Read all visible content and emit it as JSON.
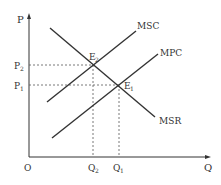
{
  "diagram": {
    "type": "economics-externality",
    "axes": {
      "y_label": "P",
      "x_label": "Q",
      "origin_label": "O"
    },
    "curves": [
      {
        "name": "MSC",
        "label": "MSC"
      },
      {
        "name": "MPC",
        "label": "MPC"
      },
      {
        "name": "MSR",
        "label": "MSR"
      }
    ],
    "points": [
      {
        "name": "E2",
        "label": "E",
        "sub": "2"
      },
      {
        "name": "E1",
        "label": "E",
        "sub": "1"
      }
    ],
    "price_levels": [
      {
        "label": "P",
        "sub": "2"
      },
      {
        "label": "P",
        "sub": "1"
      }
    ],
    "quantity_levels": [
      {
        "label": "Q",
        "sub": "2"
      },
      {
        "label": "Q",
        "sub": "1"
      }
    ],
    "colors": {
      "line": "#333333",
      "dashed": "#555555"
    }
  }
}
